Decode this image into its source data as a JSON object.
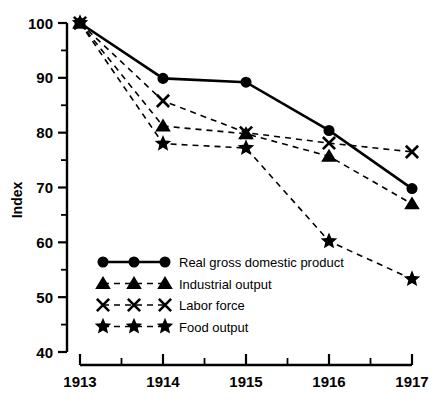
{
  "chart_data": {
    "type": "line",
    "title": "",
    "xlabel": "",
    "ylabel": "Index",
    "x": [
      1913,
      1914,
      1915,
      1916,
      1917
    ],
    "xtick_labels": [
      "1913",
      "1914",
      "1915",
      "1916",
      "1917"
    ],
    "ytick_labels": [
      "40",
      "50",
      "60",
      "70",
      "80",
      "90",
      "100"
    ],
    "ytick_values": [
      40,
      50,
      60,
      70,
      80,
      90,
      100
    ],
    "yminor_values": [
      45,
      55,
      65,
      75,
      85,
      95
    ],
    "ylim": [
      40,
      100
    ],
    "xlim": [
      1913,
      1917
    ],
    "grid": false,
    "legend_position": "lower left inside",
    "series": [
      {
        "name": "Real gross domestic product",
        "marker": "circle",
        "linestyle": "solid",
        "color": "#000000",
        "values": [
          100,
          89.9,
          89.2,
          80.4,
          69.8
        ]
      },
      {
        "name": "Industrial output",
        "marker": "triangle",
        "linestyle": "dashed",
        "color": "#000000",
        "values": [
          100,
          81.2,
          79.8,
          75.7,
          67.0
        ]
      },
      {
        "name": "Labor force",
        "marker": "x",
        "linestyle": "dashed",
        "color": "#000000",
        "values": [
          100,
          85.8,
          80.0,
          78.1,
          76.5
        ]
      },
      {
        "name": "Food output",
        "marker": "star",
        "linestyle": "dashed",
        "color": "#000000",
        "values": [
          100,
          78.0,
          77.2,
          60.2,
          53.3
        ]
      }
    ]
  },
  "legend": {
    "items": [
      {
        "label": "Real gross domestic product",
        "marker": "circle",
        "linestyle": "solid"
      },
      {
        "label": "Industrial output",
        "marker": "triangle",
        "linestyle": "dashed"
      },
      {
        "label": "Labor force",
        "marker": "x",
        "linestyle": "dashed"
      },
      {
        "label": "Food output",
        "marker": "star",
        "linestyle": "dashed"
      }
    ]
  }
}
